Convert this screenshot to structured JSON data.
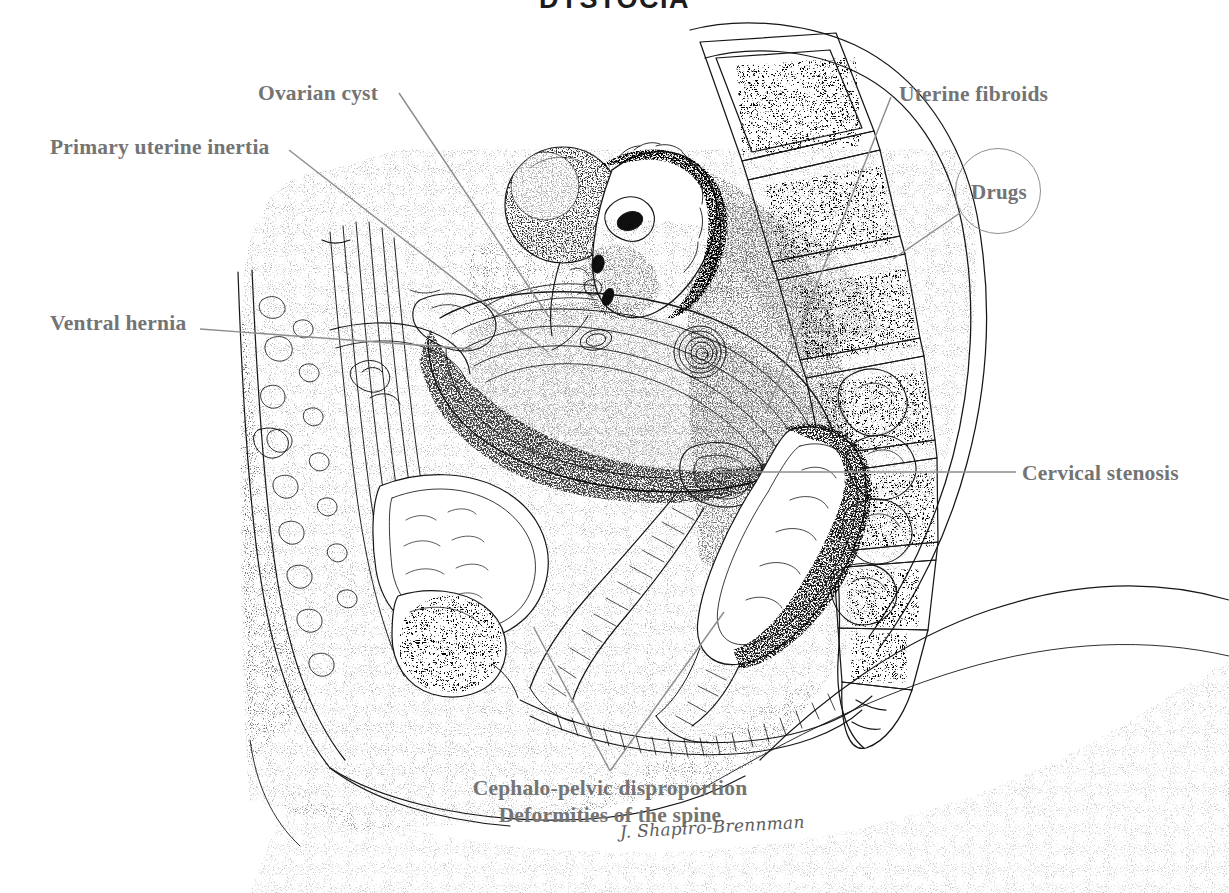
{
  "figure": {
    "title": "DYSTOCIA",
    "signature": "J. Shapiro-Brennman",
    "type": "medical-illustration",
    "colors": {
      "background": "#ffffff",
      "ink": "#1c1c1c",
      "label_text": "#747474",
      "leader_line": "#8e8e8e",
      "title_text": "#1c1c1c"
    }
  },
  "labels": {
    "ovarian_cyst": "Ovarian cyst",
    "primary_uterine_inertia": "Primary uterine inertia",
    "ventral_hernia": "Ventral hernia",
    "uterine_fibroids": "Uterine fibroids",
    "drugs": "Drugs",
    "cervical_stenosis": "Cervical stenosis",
    "cephalo_pelvic_disproportion": "Cephalo-pelvic disproportion",
    "deformities_of_the_spine": "Deformities of the spine"
  },
  "callouts": [
    {
      "name": "ovarian-cyst",
      "label": "Ovarian cyst",
      "side": "left",
      "text_x": 258,
      "text_y": 81,
      "leader_from": [
        398,
        92
      ],
      "leader_to": [
        549,
        316
      ]
    },
    {
      "name": "primary-uterine-inertia",
      "label": "Primary uterine inertia",
      "side": "left",
      "text_x": 50,
      "text_y": 135,
      "leader_from": [
        288,
        149
      ],
      "leader_to": [
        545,
        349
      ]
    },
    {
      "name": "ventral-hernia",
      "label": "Ventral hernia",
      "side": "left",
      "text_x": 50,
      "text_y": 311,
      "leader_from": [
        199,
        328
      ],
      "leader_to": [
        470,
        347
      ]
    },
    {
      "name": "uterine-fibroids",
      "label": "Uterine fibroids",
      "side": "right",
      "text_x": 899,
      "text_y": 82,
      "leader_from": [
        890,
        96
      ],
      "leader_to": [
        766,
        412
      ]
    },
    {
      "name": "drugs",
      "label": "Drugs",
      "side": "right",
      "text_x": 955,
      "text_y": 148,
      "leader_from": [
        961,
        212
      ],
      "leader_to": [
        895,
        258
      ]
    },
    {
      "name": "cervical-stenosis",
      "label": "Cervical stenosis",
      "side": "right",
      "text_x": 1022,
      "text_y": 461,
      "leader_from": [
        1015,
        472
      ],
      "leader_to": [
        720,
        472
      ]
    },
    {
      "name": "cephalo-pelvic",
      "label": "Cephalo-pelvic disproportion",
      "side": "bottom",
      "text_x": 430,
      "text_y": 776,
      "leader_from": [
        610,
        770
      ],
      "leader_to": [
        533,
        628
      ]
    },
    {
      "name": "deformities-spine",
      "label": "Deformities of the spine",
      "side": "bottom",
      "text_x": 430,
      "text_y": 803,
      "leader_from": [
        610,
        770
      ],
      "leader_to": [
        723,
        612
      ]
    }
  ],
  "anatomy_features": [
    "ovarian cyst",
    "gravid uterus with fetus",
    "uterine fibroid (leiomyoma)",
    "lumbar vertebrae and sacrum with trabecular bone",
    "urinary bladder",
    "pubic symphysis",
    "rectum and anal canal",
    "small bowel loops",
    "abdominal wall with rectus muscle",
    "cervix and vaginal canal"
  ]
}
